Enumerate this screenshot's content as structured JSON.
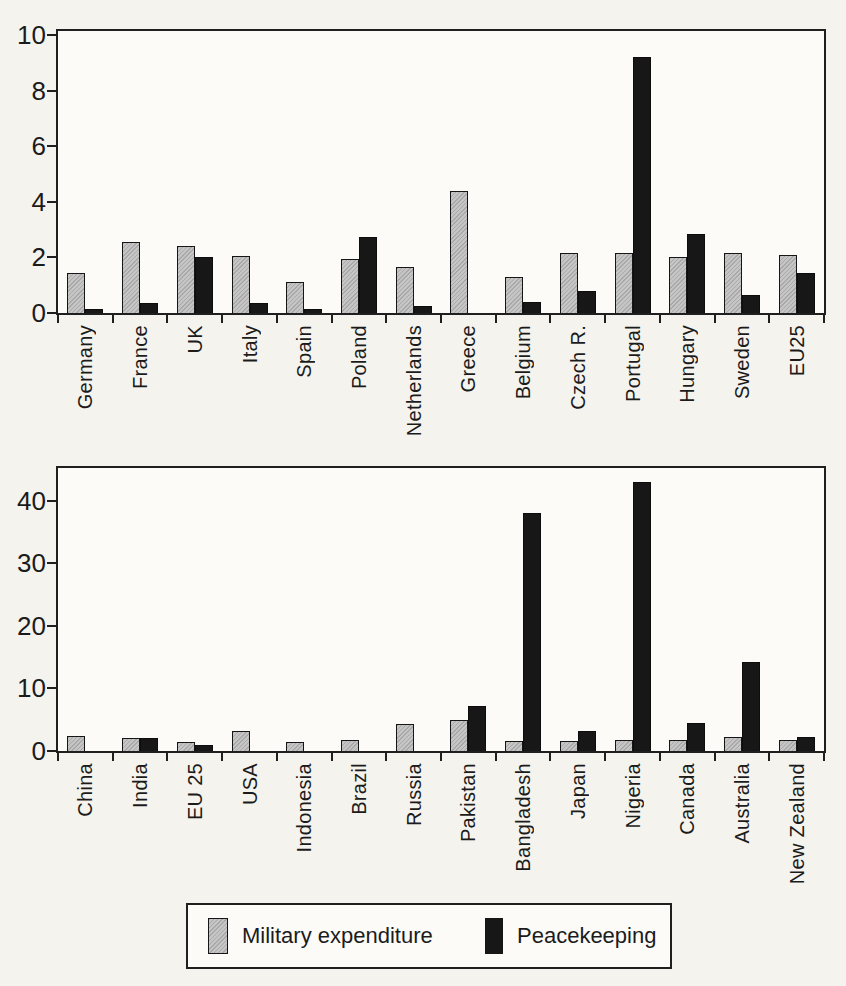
{
  "legend": {
    "items": [
      {
        "label": "Military expenditure",
        "color": "#c5c5c5"
      },
      {
        "label": "Peacekeeping",
        "color": "#171717"
      }
    ]
  },
  "chart_data": [
    {
      "type": "bar",
      "title": "",
      "xlabel": "",
      "ylabel": "",
      "grid": false,
      "legend_position": "shared-bottom-box",
      "categories": [
        "Germany",
        "France",
        "UK",
        "Italy",
        "Spain",
        "Poland",
        "Netherlands",
        "Greece",
        "Belgium",
        "Czech R.",
        "Portugal",
        "Hungary",
        "Sweden",
        "EU25"
      ],
      "series": [
        {
          "name": "Military expenditure",
          "color": "#c5c5c5",
          "values": [
            1.45,
            2.55,
            2.4,
            2.05,
            1.1,
            1.95,
            1.65,
            4.4,
            1.3,
            2.15,
            2.15,
            2.0,
            2.15,
            2.1
          ]
        },
        {
          "name": "Peacekeeping",
          "color": "#171717",
          "values": [
            0.15,
            0.35,
            2.0,
            0.35,
            0.15,
            2.75,
            0.25,
            0,
            0.4,
            0.8,
            9.2,
            2.85,
            0.65,
            1.45
          ]
        }
      ],
      "yticks": [
        0,
        2,
        4,
        6,
        8,
        10
      ],
      "ylim": [
        0,
        10.15
      ]
    },
    {
      "type": "bar",
      "title": "",
      "xlabel": "",
      "ylabel": "",
      "grid": false,
      "legend_position": "shared-bottom-box",
      "categories": [
        "China",
        "India",
        "EU 25",
        "USA",
        "Indonesia",
        "Brazil",
        "Russia",
        "Pakistan",
        "Bangladesh",
        "Japan",
        "Nigeria",
        "Canada",
        "Australia",
        "New Zealand"
      ],
      "series": [
        {
          "name": "Military expenditure",
          "color": "#c5c5c5",
          "values": [
            2.4,
            2.1,
            1.5,
            3.2,
            1.4,
            1.8,
            4.3,
            5.0,
            1.6,
            1.6,
            1.8,
            1.8,
            2.3,
            1.7
          ]
        },
        {
          "name": "Peacekeeping",
          "color": "#171717",
          "values": [
            0,
            2.1,
            0.9,
            0,
            0,
            0,
            0,
            7.2,
            38,
            3.2,
            43,
            4.5,
            14.2,
            2.2
          ]
        }
      ],
      "yticks": [
        0,
        10,
        20,
        30,
        40
      ],
      "ylim": [
        0,
        45.2
      ]
    }
  ]
}
